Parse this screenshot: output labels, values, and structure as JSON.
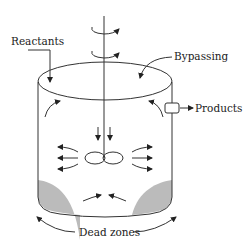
{
  "diagram": {
    "type": "stirred tank reactor non-ideal flow",
    "labels": {
      "reactants": "Reactants",
      "bypassing": "Bypassing",
      "products": "Products",
      "dead_zones": "Dead zones"
    },
    "colors": {
      "line": "#333333",
      "dead_zone_fill": "#bbbbbb"
    }
  }
}
